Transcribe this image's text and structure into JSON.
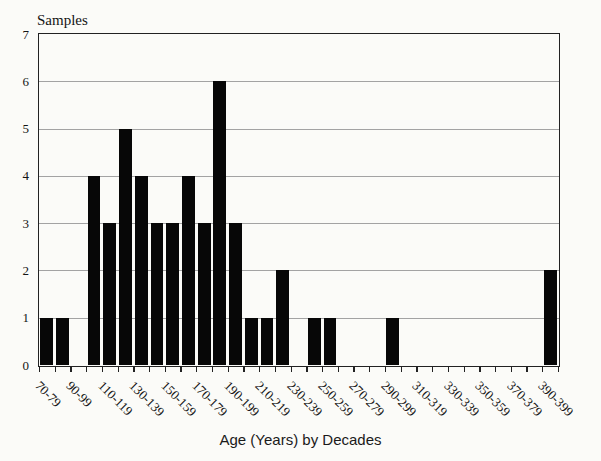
{
  "chart_data": {
    "type": "bar",
    "ylabel": "Samples",
    "xlabel": "Age (Years) by Decades",
    "categories": [
      "70-79",
      "80-89",
      "90-99",
      "100-109",
      "110-119",
      "120-129",
      "130-139",
      "140-149",
      "150-159",
      "160-169",
      "170-179",
      "180-189",
      "190-199",
      "200-209",
      "210-219",
      "220-229",
      "230-239",
      "240-249",
      "250-259",
      "260-269",
      "270-279",
      "280-289",
      "290-299",
      "300-309",
      "310-319",
      "320-329",
      "330-339",
      "340-349",
      "350-359",
      "360-369",
      "370-379",
      "380-389",
      "390-399"
    ],
    "values": [
      1,
      1,
      0,
      4,
      3,
      5,
      4,
      3,
      3,
      4,
      3,
      6,
      3,
      1,
      1,
      2,
      0,
      1,
      1,
      0,
      0,
      0,
      1,
      0,
      0,
      0,
      0,
      0,
      0,
      0,
      0,
      0,
      2
    ],
    "x_label_every": 2,
    "visible_x_labels": [
      "70-79",
      "90-99",
      "110-119",
      "130-139",
      "150-159",
      "170-179",
      "190-199",
      "210-219",
      "230-239",
      "250-259",
      "270-279",
      "290-299",
      "310-319",
      "330-339",
      "350-359",
      "370-379",
      "390-399"
    ],
    "ylim": [
      0,
      7
    ],
    "yticks": [
      0,
      1,
      2,
      3,
      4,
      5,
      6,
      7
    ],
    "grid": "horizontal",
    "legend": "none",
    "bar_color": "#070707",
    "gridline_color": "#a3a3a3",
    "axis_color": "#222222",
    "background_color": "#fbfbf8"
  }
}
